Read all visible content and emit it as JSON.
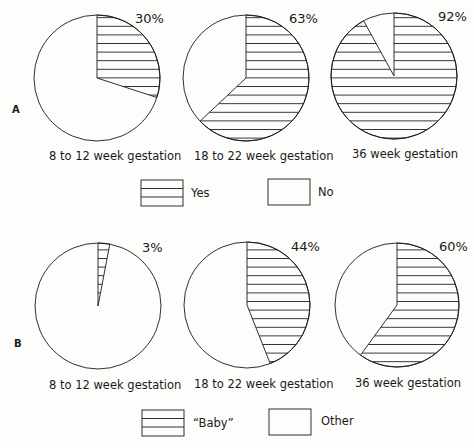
{
  "chart_data": [
    {
      "type": "pie",
      "panel": "A",
      "legend": [
        {
          "label": "Yes",
          "pattern": "horizontal-hatch"
        },
        {
          "label": "No",
          "pattern": "blank"
        }
      ],
      "pies": [
        {
          "label": "8 to 12 week gestation",
          "values": {
            "Yes": 30,
            "No": 70
          },
          "annotation": "30%"
        },
        {
          "label": "18 to 22 week gestation",
          "values": {
            "Yes": 63,
            "No": 37
          },
          "annotation": "63%"
        },
        {
          "label": "36 week gestation",
          "values": {
            "Yes": 92,
            "No": 8
          },
          "annotation": "92%"
        }
      ]
    },
    {
      "type": "pie",
      "panel": "B",
      "legend": [
        {
          "label": "“Baby”",
          "pattern": "horizontal-hatch"
        },
        {
          "label": "Other",
          "pattern": "blank"
        }
      ],
      "pies": [
        {
          "label": "8 to 12 week gestation",
          "values": {
            "Baby": 3,
            "Other": 97
          },
          "annotation": "3%"
        },
        {
          "label": "18 to 22 week gestation",
          "values": {
            "Baby": 44,
            "Other": 56
          },
          "annotation": "44%"
        },
        {
          "label": "36 week gestation",
          "values": {
            "Baby": 60,
            "Other": 40
          },
          "annotation": "60%"
        }
      ]
    }
  ],
  "panels": {
    "A": {
      "label": "A",
      "pies": [
        {
          "pct": 30,
          "pct_label": "30%",
          "caption": "8 to 12 week gestation"
        },
        {
          "pct": 63,
          "pct_label": "63%",
          "caption": "18 to 22 week gestation"
        },
        {
          "pct": 92,
          "pct_label": "92%",
          "caption": "36 week gestation"
        }
      ],
      "legend": {
        "hatched": "Yes",
        "blank": "No"
      }
    },
    "B": {
      "label": "B",
      "pies": [
        {
          "pct": 3,
          "pct_label": "3%",
          "caption": "8 to 12 week gestation"
        },
        {
          "pct": 44,
          "pct_label": "44%",
          "caption": "18 to 22 week gestation"
        },
        {
          "pct": 60,
          "pct_label": "60%",
          "caption": "36 week gestation"
        }
      ],
      "legend": {
        "hatched": "“Baby”",
        "blank": "Other"
      }
    }
  },
  "colors": {
    "ink": "#1a1a1a",
    "paper": "#fdfdfb"
  }
}
